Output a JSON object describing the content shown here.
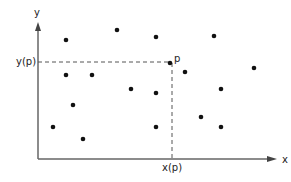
{
  "diagram": {
    "x_axis_label": "x",
    "y_axis_label": "y",
    "point_label": "p",
    "xp_label": "x(p)",
    "yp_label": "y(p)",
    "colors": {
      "axis": "#666666",
      "point": "#111111",
      "dash": "#555555"
    }
  },
  "chart_data": {
    "type": "scatter",
    "title": "",
    "xlabel": "x",
    "ylabel": "y",
    "highlighted_point": {
      "label": "p",
      "x": 170,
      "y": 63
    },
    "points_pixel": [
      [
        66,
        40
      ],
      [
        117,
        30
      ],
      [
        156,
        37
      ],
      [
        214,
        36
      ],
      [
        66,
        75
      ],
      [
        92,
        75
      ],
      [
        131,
        89
      ],
      [
        156,
        93
      ],
      [
        170,
        63
      ],
      [
        185,
        72
      ],
      [
        254,
        68
      ],
      [
        221,
        89
      ],
      [
        73,
        105
      ],
      [
        53,
        127
      ],
      [
        83,
        139
      ],
      [
        156,
        127
      ],
      [
        201,
        117
      ],
      [
        221,
        127
      ]
    ],
    "annotations": [
      "x(p)",
      "y(p)"
    ]
  }
}
